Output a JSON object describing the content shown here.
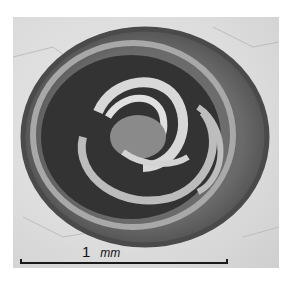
{
  "image": {
    "subject": "spiral shell micrograph",
    "style": "grayscale",
    "colors": {
      "background": "#dcdcdc",
      "outer_ring": "#6e6e6e",
      "dark_whorl": "#3a3a3a",
      "light_whorl": "#cfcfcf"
    }
  },
  "scale_bar": {
    "value": "1",
    "unit": "mm"
  }
}
